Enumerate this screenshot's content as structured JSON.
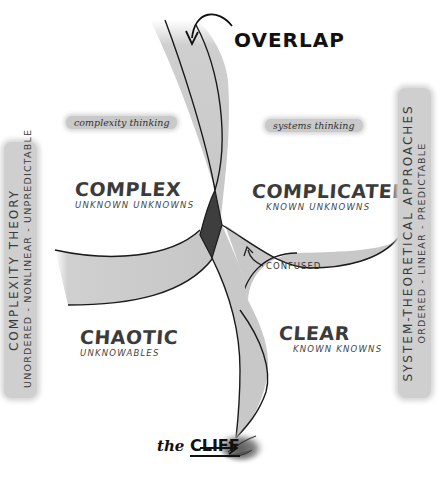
{
  "title_annotations": {
    "overlap": "OVERLAP",
    "confused": "CONFUSED",
    "cliff_prefix": "the",
    "cliff_word": "CLIFF"
  },
  "thinking_tags": {
    "left": "complexity thinking",
    "right": "systems thinking"
  },
  "side_bands": {
    "left": {
      "line1": "COMPLEXITY THEORY",
      "line2": "UNORDERED - NONLINEAR - UNPREDICTABLE"
    },
    "right": {
      "line1": "SYSTEM-THEORETICAL APPROACHES",
      "line2": "ORDERED - LINEAR - PREDICTABLE"
    }
  },
  "domains": {
    "complex": {
      "title": "COMPLEX",
      "subtitle": "UNKNOWN UNKNOWNS"
    },
    "complicated": {
      "title": "COMPLICATED",
      "subtitle": "KNOWN UNKNOWNS"
    },
    "chaotic": {
      "title": "CHAOTIC",
      "subtitle": "UNKNOWABLES"
    },
    "clear": {
      "title": "CLEAR",
      "subtitle": "KNOWN KNOWNS"
    }
  },
  "colors": {
    "ink": "#1a1a1a",
    "band_fill": "#c8c8c8",
    "center_fill": "#3e3e3e",
    "paper": "#ffffff"
  }
}
